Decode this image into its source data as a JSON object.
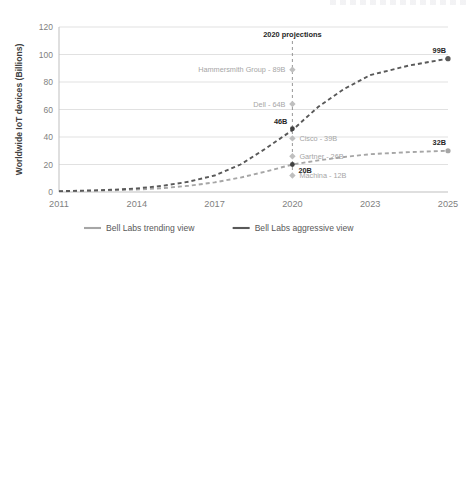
{
  "page": {
    "background": "#ffffff",
    "clipped_header_note": ""
  },
  "colors": {
    "grid": "#d9d9d9",
    "axis": "#bfbfbf",
    "tick_text": "#7f7f7f",
    "title_text": "#404040",
    "trending": "#a6a6a6",
    "aggressive": "#595959",
    "machina": "#404040",
    "annotation_light": "#a6a6a6",
    "annotation_dark": "#404040",
    "data_label": "#262626"
  },
  "chart_data": [
    {
      "id": "worldwide-iot-devices",
      "type": "line",
      "title": "",
      "xlabel": "",
      "ylabel": "Worldwide IoT devices (Billions)",
      "ylim": [
        0,
        120
      ],
      "yticks": [
        0,
        20,
        40,
        60,
        80,
        100,
        120
      ],
      "categories": [
        "2011",
        "2014",
        "2017",
        "2020",
        "2023",
        "2025"
      ],
      "xticks": [
        "2011",
        "2014",
        "2017",
        "2020",
        "2023",
        "2025"
      ],
      "grid": true,
      "legend_position": "bottom",
      "series": [
        {
          "name": "Bell Labs trending view",
          "color": "#a6a6a6",
          "style": "dashed",
          "x": [
            2011,
            2012,
            2013,
            2014,
            2015,
            2016,
            2017,
            2018,
            2019,
            2020,
            2021,
            2022,
            2023,
            2024,
            2025
          ],
          "values": [
            0.5,
            0.8,
            1.2,
            1.8,
            2.8,
            4.5,
            7.0,
            10.5,
            15.0,
            20.0,
            23.0,
            25.5,
            27.5,
            29.0,
            30.0
          ],
          "end_label": "32B"
        },
        {
          "name": "Bell Labs aggressive view",
          "color": "#595959",
          "style": "dashed",
          "x": [
            2011,
            2012,
            2013,
            2014,
            2015,
            2016,
            2017,
            2018,
            2019,
            2020,
            2021,
            2022,
            2023,
            2024,
            2025
          ],
          "values": [
            0.6,
            1.0,
            1.6,
            2.6,
            4.5,
            7.5,
            12.0,
            20.0,
            32.0,
            45.0,
            62.0,
            75.0,
            85.0,
            92.0,
            97.0
          ],
          "end_label": "99B"
        }
      ],
      "projection_marker": {
        "label": "2020 projections",
        "at_year": 2020,
        "top_value": 120,
        "bottom_value": 12
      },
      "projections": [
        {
          "label": "Hammersmith Group - 89B",
          "value": 89,
          "side": "left",
          "tone": "light"
        },
        {
          "label": "Dell - 64B",
          "value": 64,
          "side": "left",
          "tone": "light"
        },
        {
          "label": "Cisco - 39B",
          "value": 39,
          "side": "right",
          "tone": "light"
        },
        {
          "label": "Gartner - 26B",
          "value": 26,
          "side": "right",
          "tone": "light"
        },
        {
          "label": "Machina - 12B",
          "value": 12,
          "side": "right",
          "tone": "light"
        }
      ],
      "point_labels": [
        {
          "text": "46B",
          "value": 46,
          "at_year": 2020,
          "align": "left"
        },
        {
          "text": "20B",
          "value": 20,
          "at_year": 2020,
          "align": "right"
        }
      ],
      "legend": [
        {
          "label": "Bell Labs trending view",
          "color": "#a6a6a6"
        },
        {
          "label": "Bell Labs aggressive view",
          "color": "#595959"
        }
      ]
    },
    {
      "id": "worldwide-cellular-iot-devices",
      "type": "line",
      "title": "",
      "xlabel": "",
      "ylabel": "Worldwide cellular IoT devices (Billions)",
      "ylim": [
        0,
        30
      ],
      "yticks": [
        0,
        5,
        10,
        15,
        20,
        25,
        30
      ],
      "categories": [
        "2011",
        "2013",
        "2015",
        "2017",
        "2019",
        "2021",
        "2023",
        "2025"
      ],
      "xticks": [
        "2011",
        "2013",
        "2015",
        "2017",
        "2019",
        "2021",
        "2023",
        "2025"
      ],
      "grid": true,
      "legend_position": "bottom",
      "series": [
        {
          "name": "Machina",
          "color": "#404040",
          "style": "dashed",
          "x": [
            2011,
            2012,
            2013,
            2014,
            2015,
            2016,
            2017,
            2018,
            2019,
            2020,
            2021,
            2022,
            2023,
            2024
          ],
          "values": [
            0.25,
            0.25,
            0.28,
            0.32,
            0.45,
            0.6,
            0.8,
            1.0,
            1.2,
            1.4,
            1.5,
            1.6,
            1.7,
            1.8
          ],
          "end_label": "2B"
        },
        {
          "name": "Bell Labs trending view",
          "color": "#a6a6a6",
          "style": "dashed",
          "x": [
            2011,
            2012,
            2013,
            2014,
            2015,
            2016,
            2017,
            2018,
            2019,
            2020,
            2021,
            2022,
            2023,
            2024,
            2025
          ],
          "values": [
            0.25,
            0.25,
            0.28,
            0.32,
            0.45,
            0.6,
            0.85,
            1.1,
            1.3,
            1.5,
            2.0,
            2.5,
            3.0,
            3.6,
            4.3
          ],
          "end_label": "4B"
        },
        {
          "name": "Bell Labs aggressive view",
          "color": "#595959",
          "style": "dashed",
          "x": [
            2011,
            2012,
            2013,
            2014,
            2015,
            2016,
            2017,
            2018,
            2019,
            2020,
            2021,
            2022,
            2023,
            2024,
            2025
          ],
          "values": [
            0.25,
            0.25,
            0.28,
            0.35,
            0.5,
            0.7,
            1.0,
            1.6,
            2.8,
            4.8,
            10.5,
            14.5,
            18.5,
            22.0,
            25.5
          ],
          "end_label": "26B"
        }
      ],
      "point_labels": [
        {
          "text": "5B",
          "value": 4.8,
          "at_year": 2020,
          "align": "left"
        },
        {
          "text": "2B",
          "value": 1.5,
          "at_year": 2020,
          "align": "left"
        },
        {
          "text": "2B",
          "value": 1.8,
          "at_year": 2024,
          "align": "right"
        }
      ],
      "legend": [
        {
          "label": "Machina",
          "color": "#404040"
        },
        {
          "label": "Bell Labs trending view",
          "color": "#a6a6a6"
        },
        {
          "label": "Bell Labs aggressive view",
          "color": "#595959"
        }
      ]
    }
  ]
}
